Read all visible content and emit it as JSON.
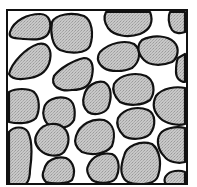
{
  "diagram": {
    "type": "granular-packing-schematic",
    "colors": {
      "background": "#ffffff",
      "pore_space": "#ffffff",
      "grain_fill": "#c8c8c8",
      "grain_stipple": "#9a9a9a",
      "outline": "#111111"
    },
    "frame": {
      "x": 7,
      "y": 10,
      "width": 180,
      "height": 174
    },
    "grains": [
      {
        "id": "g1",
        "d": "M10,32 C14,20 28,14 40,14 C50,14 52,24 49,32 C46,40 36,40 24,39 C14,38 8,38 10,32 Z"
      },
      {
        "id": "g2",
        "d": "M52,22 C56,14 72,12 84,16 C92,20 94,34 90,46 C86,54 70,54 60,50 C52,46 50,32 52,22 Z"
      },
      {
        "id": "g3",
        "d": "M106,12 L150,12 C154,22 150,30 140,34 C128,38 114,36 108,28 C104,22 104,16 106,12 Z"
      },
      {
        "id": "g4",
        "d": "M170,12 L185,12 L185,32 C180,34 174,33 172,30 C168,24 168,16 170,12 Z"
      },
      {
        "id": "g5",
        "d": "M9,74 C12,62 26,48 38,44 C48,42 52,50 50,60 C48,70 42,76 30,78 C20,80 12,80 9,74 Z"
      },
      {
        "id": "g6",
        "d": "M54,76 C60,68 74,60 84,58 C92,58 94,66 92,76 C90,86 84,90 72,90 C60,92 50,86 54,76 Z"
      },
      {
        "id": "g7",
        "d": "M100,52 C110,42 126,40 134,44 C142,50 140,62 132,68 C124,72 110,72 104,68 C98,64 96,58 100,52 Z"
      },
      {
        "id": "g8",
        "d": "M142,40 C154,34 168,36 174,42 C180,48 178,58 172,62 C162,66 150,66 144,60 C138,54 136,46 142,40 Z"
      },
      {
        "id": "g9",
        "d": "M178,58 L185,54 L185,82 C180,82 176,78 176,72 C176,66 176,62 178,58 Z"
      },
      {
        "id": "g10",
        "d": "M9,92 C16,88 28,88 34,92 C40,98 40,110 36,118 C30,124 18,124 9,122 Z"
      },
      {
        "id": "g11",
        "d": "M44,108 C46,100 56,96 66,98 C74,100 76,110 74,120 C70,128 58,130 50,126 C44,122 42,114 44,108 Z"
      },
      {
        "id": "g12",
        "d": "M84,96 C86,86 96,80 104,82 C112,86 112,98 108,108 C104,114 94,116 88,112 C84,108 82,102 84,96 Z"
      },
      {
        "id": "g13",
        "d": "M114,84 C120,74 136,72 146,76 C154,80 156,92 150,100 C142,106 128,106 120,102 C114,96 112,90 114,84 Z"
      },
      {
        "id": "g14",
        "d": "M156,96 C162,88 176,86 185,88 L185,124 C178,126 166,124 160,118 C154,112 152,104 156,96 Z"
      },
      {
        "id": "g15",
        "d": "M9,132 C14,126 24,126 28,132 C32,140 32,156 30,170 C30,178 28,182 26,184 L9,184 Z"
      },
      {
        "id": "g16",
        "d": "M38,132 C44,122 58,122 64,128 C70,134 70,144 64,152 C58,158 46,156 40,150 C34,144 34,138 38,132 Z"
      },
      {
        "id": "g17",
        "d": "M44,170 C46,160 56,156 66,158 C74,162 76,172 72,180 C68,184 52,184 46,182 C42,178 42,174 44,170 Z"
      },
      {
        "id": "g18",
        "d": "M76,136 C80,124 92,118 104,120 C114,124 116,134 112,146 C106,154 92,156 82,152 C76,148 74,142 76,136 Z"
      },
      {
        "id": "g19",
        "d": "M88,166 C92,156 102,152 112,154 C120,158 120,170 116,178 C112,184 98,184 92,180 C88,176 86,170 88,166 Z"
      },
      {
        "id": "g20",
        "d": "M118,118 C124,108 138,106 148,110 C156,114 156,126 150,134 C144,140 130,140 124,136 C118,130 116,124 118,118 Z"
      },
      {
        "id": "g21",
        "d": "M124,156 C126,146 140,140 152,144 C160,150 162,164 158,176 C156,182 150,184 140,184 C130,184 124,182 122,174 C120,168 122,162 124,156 Z"
      },
      {
        "id": "g22",
        "d": "M160,134 C164,128 176,126 185,128 L185,162 C178,164 168,162 164,156 C158,150 156,140 160,134 Z"
      },
      {
        "id": "g23",
        "d": "M166,176 C170,170 180,170 185,172 L185,184 L166,184 C164,182 164,178 166,176 Z"
      }
    ]
  }
}
